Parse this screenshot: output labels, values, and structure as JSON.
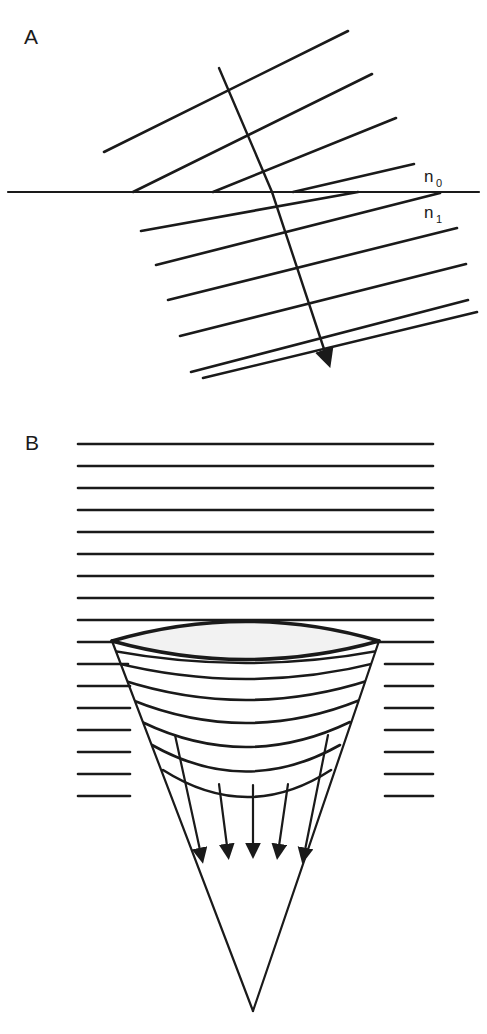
{
  "figure": {
    "background_color": "#ffffff",
    "ink_color": "#1a1a1a",
    "width": 487,
    "height": 1034
  },
  "panels": [
    {
      "id": "A",
      "label": "A",
      "label_x": 24,
      "label_y": 44,
      "description": "Plane wavefronts refracting at a flat interface between two media",
      "interface": {
        "name": "refracting-interface",
        "x1": 8,
        "x2": 479,
        "y": 192,
        "upper_medium_label": "n",
        "upper_medium_subscript": "0",
        "upper_label_x": 424,
        "upper_label_y": 182,
        "lower_medium_label": "n",
        "lower_medium_subscript": "1",
        "lower_label_x": 424,
        "lower_label_y": 218
      },
      "incident_wavefronts": {
        "name": "incident-wavefronts",
        "count": 4,
        "slope_deg": 25,
        "segments": [
          {
            "x1": 104,
            "y1": 152,
            "x2": 348,
            "y2": 31
          },
          {
            "x1": 133,
            "y1": 192,
            "x2": 372,
            "y2": 74
          },
          {
            "x1": 213,
            "y1": 192,
            "x2": 396,
            "y2": 118
          },
          {
            "x1": 293,
            "y1": 192,
            "x2": 414,
            "y2": 164
          }
        ]
      },
      "refracted_wavefronts": {
        "name": "refracted-wavefronts",
        "count": 6,
        "slope_deg": 17,
        "segments": [
          {
            "x1": 141,
            "y1": 230,
            "x2": 358,
            "y2": 192
          },
          {
            "x1": 155,
            "y1": 262,
            "x2": 438,
            "y2": 192
          },
          {
            "x1": 167,
            "y1": 298,
            "x2": 456,
            "y2": 226
          },
          {
            "x1": 177,
            "y1": 335,
            "x2": 465,
            "y2": 263
          },
          {
            "x1": 190,
            "y1": 371,
            "x2": 470,
            "y2": 299
          },
          {
            "x1": 205,
            "y1": 377,
            "x2": 476,
            "y2": 310
          }
        ]
      },
      "ray": {
        "name": "incident-refracted-ray",
        "incident": {
          "x1": 219,
          "y1": 68,
          "x2": 272,
          "y2": 192
        },
        "refracted": {
          "x1": 272,
          "y1": 192,
          "x2": 327,
          "y2": 358
        },
        "arrow_tip_x": 329,
        "arrow_tip_y": 364
      }
    },
    {
      "id": "B",
      "label": "B",
      "label_x": 25,
      "label_y": 450,
      "description": "Plane wavefronts converging to a focus after passing through a biconvex lens",
      "plane_wavefronts": {
        "name": "plane-wavefronts-above-lens",
        "count": 9,
        "x_left": 78,
        "x_right": 433,
        "spacing": 22,
        "y_values": [
          444,
          466,
          488,
          510,
          532,
          554,
          576,
          598,
          620
        ]
      },
      "side_wavefronts_left": {
        "name": "plane-wavefronts-left-of-cone",
        "count": 8,
        "x_left": 78,
        "y_values": [
          642,
          664,
          686,
          708,
          730,
          752,
          774,
          796
        ]
      },
      "side_wavefronts_right": {
        "name": "plane-wavefronts-right-of-cone",
        "count": 8,
        "x_right": 433,
        "y_values": [
          642,
          664,
          686,
          708,
          730,
          752,
          774,
          796
        ]
      },
      "lens": {
        "name": "biconvex-lens",
        "left_vertex_x": 112,
        "left_vertex_y": 641,
        "right_vertex_x": 379,
        "right_vertex_y": 641,
        "top_bulge_y": 612,
        "bottom_bulge_y": 661,
        "shape": "biconvex"
      },
      "cone": {
        "name": "converging-cone",
        "apex_x": 253,
        "apex_y": 1011,
        "left_edge_top_x": 112,
        "right_edge_top_x": 379,
        "edge_top_y": 641
      },
      "curved_wavefronts": {
        "name": "converging-curved-wavefronts",
        "count": 7,
        "description": "Progressively more curved downward-convex wavefronts inside the cone"
      },
      "converging_arrows": {
        "name": "converging-rays",
        "count": 5,
        "tip_y_values": [
          857,
          853,
          851,
          853,
          857
        ],
        "tip_x_values": [
          202,
          228,
          253,
          278,
          304
        ]
      }
    }
  ]
}
